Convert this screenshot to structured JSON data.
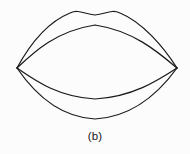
{
  "figure": {
    "caption": "(b)",
    "alt_description": "Outline line drawing of a pair of lips",
    "background_color": "#fcfcfc",
    "stroke_color": "#1a1a1a",
    "stroke_width": 1.25,
    "canvas": {
      "width": 190,
      "height": 154
    },
    "drawing_area": {
      "width": 190,
      "height": 128
    },
    "corners": {
      "left": {
        "x": 17,
        "y": 68
      },
      "right": {
        "x": 177,
        "y": 68
      }
    },
    "curves": [
      {
        "name": "upper-lip-outer",
        "role": "outer contour of the upper lip with cupid's bow",
        "path": "M17,68 C 30,44 48,22 70,13 C 79,9 84,14 95,15 C 106,14 111,9 120,13 C 142,22 163,46 177,68"
      },
      {
        "name": "upper-lip-inner",
        "role": "inner contour of the upper lip (top edge of mouth opening)",
        "path": "M17,68 C 34,52 56,31 95,25 C 134,31 158,52 177,68"
      },
      {
        "name": "lower-lip-inner",
        "role": "inner contour of the lower lip (bottom edge of mouth opening)",
        "path": "M17,68 C 36,81 58,97 95,99 C 132,97 157,81 177,68"
      },
      {
        "name": "lower-lip-outer",
        "role": "outer contour of the lower lip",
        "path": "M17,68 C 32,90 56,117 95,119 C 134,117 161,90 177,68"
      }
    ]
  }
}
